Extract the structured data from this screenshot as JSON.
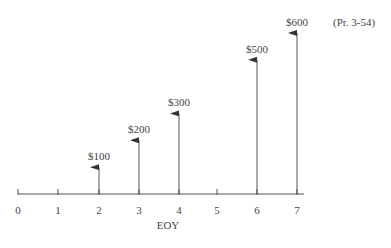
{
  "problem_ref": "(Pr. 3-54)",
  "axis": {
    "label": "EOY",
    "ticks": [
      "0",
      "1",
      "2",
      "3",
      "4",
      "5",
      "6",
      "7"
    ]
  },
  "cash_flows": [
    {
      "period": 2,
      "label": "$100",
      "amount": 100
    },
    {
      "period": 3,
      "label": "$200",
      "amount": 200
    },
    {
      "period": 4,
      "label": "$300",
      "amount": 300
    },
    {
      "period": 6,
      "label": "$500",
      "amount": 500
    },
    {
      "period": 7,
      "label": "$600",
      "amount": 600
    }
  ],
  "colors": {
    "line": "#555555",
    "text": "#444444",
    "background": "#ffffff"
  },
  "chart_data": {
    "type": "bar",
    "title": "",
    "xlabel": "EOY",
    "ylabel": "",
    "categories": [
      "0",
      "1",
      "2",
      "3",
      "4",
      "5",
      "6",
      "7"
    ],
    "values": [
      0,
      0,
      100,
      200,
      300,
      0,
      500,
      600
    ],
    "value_labels": [
      "",
      "",
      "$100",
      "$200",
      "$300",
      "",
      "$500",
      "$600"
    ],
    "annotation": "(Pr. 3-54)",
    "style": "cash-flow arrows (upward = receipts)",
    "grid": false
  }
}
